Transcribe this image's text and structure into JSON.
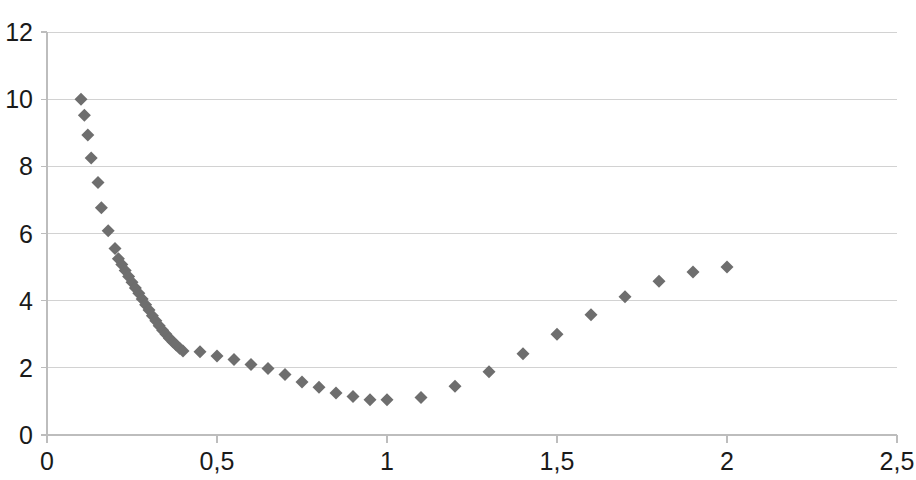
{
  "chart_data": {
    "type": "scatter",
    "title": "",
    "subtitle": "",
    "xlabel": "",
    "ylabel": "",
    "xlim": [
      0,
      2.5
    ],
    "ylim": [
      0,
      12
    ],
    "grid": true,
    "legend": null,
    "legend_position": "none",
    "marker": {
      "shape": "diamond",
      "color": "#6e6e6e",
      "size_px": 13
    },
    "axes": {
      "decimal_separator": ",",
      "x_ticks": [
        0,
        0.5,
        1,
        1.5,
        2,
        2.5
      ],
      "x_tick_labels": [
        "0",
        "0,5",
        "1",
        "1,5",
        "2",
        "2,5"
      ],
      "y_ticks": [
        0,
        2,
        4,
        6,
        8,
        10,
        12
      ],
      "y_tick_labels": [
        "0",
        "2",
        "4",
        "6",
        "8",
        "10",
        "12"
      ],
      "x_axis_color": "#bdbdbd",
      "gridline_color": "#d2d2d2",
      "background_color": "#ffffff"
    },
    "series": [
      {
        "name": "series-1",
        "points": [
          [
            0.1,
            10.0
          ],
          [
            0.11,
            9.52
          ],
          [
            0.12,
            8.93
          ],
          [
            0.13,
            8.25
          ],
          [
            0.15,
            7.52
          ],
          [
            0.16,
            6.77
          ],
          [
            0.18,
            6.08
          ],
          [
            0.2,
            5.55
          ],
          [
            0.21,
            5.25
          ],
          [
            0.22,
            5.08
          ],
          [
            0.23,
            4.9
          ],
          [
            0.24,
            4.72
          ],
          [
            0.25,
            4.55
          ],
          [
            0.26,
            4.38
          ],
          [
            0.27,
            4.22
          ],
          [
            0.28,
            4.05
          ],
          [
            0.29,
            3.88
          ],
          [
            0.3,
            3.72
          ],
          [
            0.31,
            3.55
          ],
          [
            0.32,
            3.4
          ],
          [
            0.33,
            3.25
          ],
          [
            0.34,
            3.12
          ],
          [
            0.35,
            3.0
          ],
          [
            0.36,
            2.88
          ],
          [
            0.37,
            2.78
          ],
          [
            0.38,
            2.68
          ],
          [
            0.39,
            2.58
          ],
          [
            0.4,
            2.5
          ],
          [
            0.45,
            2.48
          ],
          [
            0.5,
            2.35
          ],
          [
            0.55,
            2.25
          ],
          [
            0.6,
            2.1
          ],
          [
            0.65,
            1.98
          ],
          [
            0.7,
            1.8
          ],
          [
            0.75,
            1.58
          ],
          [
            0.8,
            1.42
          ],
          [
            0.85,
            1.25
          ],
          [
            0.9,
            1.15
          ],
          [
            0.95,
            1.05
          ],
          [
            1.0,
            1.05
          ],
          [
            1.1,
            1.12
          ],
          [
            1.2,
            1.45
          ],
          [
            1.3,
            1.88
          ],
          [
            1.4,
            2.42
          ],
          [
            1.5,
            3.0
          ],
          [
            1.6,
            3.58
          ],
          [
            1.7,
            4.12
          ],
          [
            1.8,
            4.58
          ],
          [
            1.9,
            4.85
          ],
          [
            2.0,
            5.0
          ]
        ]
      }
    ]
  }
}
